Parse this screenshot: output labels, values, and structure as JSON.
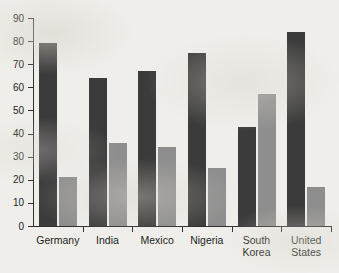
{
  "chart_data": {
    "type": "bar",
    "title": "",
    "subtitle": "",
    "xlabel": "",
    "ylabel": "",
    "ylim": [
      0,
      90
    ],
    "ytick_step": 10,
    "yticks": [
      90,
      80,
      70,
      60,
      50,
      40,
      30,
      20,
      10,
      0
    ],
    "grid": false,
    "legend": "none",
    "orientation": "vertical",
    "grouping": "grouped",
    "categories": [
      "Germany",
      "India",
      "Mexico",
      "Nigeria",
      "South Korea",
      "United States"
    ],
    "category_label_lines": [
      [
        "Germany"
      ],
      [
        "India"
      ],
      [
        "Mexico"
      ],
      [
        "Nigeria"
      ],
      [
        "South",
        "Korea"
      ],
      [
        "United",
        "States"
      ]
    ],
    "series": [
      {
        "name": "series-1",
        "color": "#3b3b3b",
        "values": [
          79,
          64,
          67,
          75,
          43,
          84
        ]
      },
      {
        "name": "series-2",
        "color": "#8e8e8e",
        "values": [
          21,
          36,
          34,
          25,
          57,
          17
        ]
      }
    ]
  },
  "style": {
    "background_color": "#efeeea",
    "axis_color": "#2f2f2d",
    "text_color": "#1d1d1b",
    "series_1_color": "#3b3b3b",
    "series_2_color": "#8e8e8e"
  }
}
